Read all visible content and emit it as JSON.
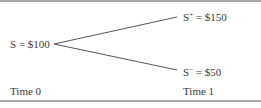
{
  "diagram": {
    "type": "binomial-tree",
    "root": {
      "symbol": "S",
      "eq": " = ",
      "value": "$100"
    },
    "up": {
      "symbol": "S",
      "sup": "+",
      "eq": " = ",
      "value": "$150"
    },
    "down": {
      "symbol": "S",
      "sup": "−",
      "eq": " = ",
      "value": "$50"
    },
    "time_labels": [
      "Time 0",
      "Time 1"
    ],
    "colors": {
      "line": "#555555",
      "rule": "#a8a8a8",
      "text": "#3a3a3a"
    }
  }
}
